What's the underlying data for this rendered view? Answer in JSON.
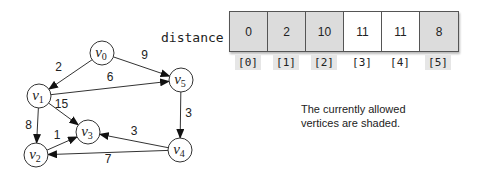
{
  "graph": {
    "nodes": [
      {
        "id": "v0",
        "base": "v",
        "sub": "0",
        "x": 102,
        "y": 53
      },
      {
        "id": "v1",
        "base": "v",
        "sub": "1",
        "x": 39,
        "y": 96
      },
      {
        "id": "v2",
        "base": "v",
        "sub": "2",
        "x": 36,
        "y": 155
      },
      {
        "id": "v3",
        "base": "v",
        "sub": "3",
        "x": 88,
        "y": 132
      },
      {
        "id": "v4",
        "base": "v",
        "sub": "4",
        "x": 180,
        "y": 150
      },
      {
        "id": "v5",
        "base": "v",
        "sub": "5",
        "x": 181,
        "y": 80
      }
    ],
    "edges": [
      {
        "from": "v0",
        "to": "v1",
        "weight": "2"
      },
      {
        "from": "v0",
        "to": "v5",
        "weight": "9"
      },
      {
        "from": "v1",
        "to": "v5",
        "weight": "6"
      },
      {
        "from": "v1",
        "to": "v3",
        "weight": "15"
      },
      {
        "from": "v1",
        "to": "v2",
        "weight": "8"
      },
      {
        "from": "v2",
        "to": "v3",
        "weight": "1"
      },
      {
        "from": "v5",
        "to": "v4",
        "weight": "3"
      },
      {
        "from": "v4",
        "to": "v3",
        "weight": "3"
      },
      {
        "from": "v4",
        "to": "v2",
        "weight": "7"
      }
    ]
  },
  "array": {
    "label": "distance",
    "cells": [
      {
        "value": "0",
        "index": "[0]",
        "shaded": true
      },
      {
        "value": "2",
        "index": "[1]",
        "shaded": true
      },
      {
        "value": "10",
        "index": "[2]",
        "shaded": true
      },
      {
        "value": "11",
        "index": "[3]",
        "shaded": false
      },
      {
        "value": "11",
        "index": "[4]",
        "shaded": false
      },
      {
        "value": "8",
        "index": "[5]",
        "shaded": true
      }
    ]
  },
  "note": {
    "line1": "The currently allowed",
    "line2": "vertices are shaded."
  },
  "colors": {
    "shaded": "#dcdcdc",
    "index_shaded": "#e6e6e6",
    "stroke": "#333333"
  }
}
